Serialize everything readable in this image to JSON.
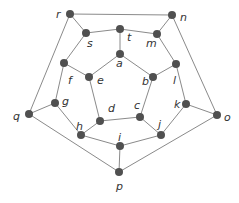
{
  "diagram": {
    "type": "graph",
    "nodes": [
      {
        "id": "r",
        "label": "r",
        "x": 70,
        "y": 14,
        "lx": 56,
        "ly": 18
      },
      {
        "id": "n",
        "label": "n",
        "x": 172,
        "y": 15,
        "lx": 180,
        "ly": 21
      },
      {
        "id": "s",
        "label": "s",
        "x": 86,
        "y": 33,
        "lx": 87,
        "ly": 47
      },
      {
        "id": "t",
        "label": "t",
        "x": 120,
        "y": 29,
        "lx": 127,
        "ly": 41
      },
      {
        "id": "m",
        "label": "m",
        "x": 157,
        "y": 34,
        "lx": 146,
        "ly": 47
      },
      {
        "id": "a",
        "label": "a",
        "x": 120,
        "y": 54,
        "lx": 116,
        "ly": 67
      },
      {
        "id": "f",
        "label": "f",
        "x": 64,
        "y": 63,
        "lx": 68,
        "ly": 84
      },
      {
        "id": "e",
        "label": "e",
        "x": 89,
        "y": 77,
        "lx": 97,
        "ly": 84
      },
      {
        "id": "b",
        "label": "b",
        "x": 153,
        "y": 77,
        "lx": 142,
        "ly": 85
      },
      {
        "id": "l",
        "label": "l",
        "x": 176,
        "y": 64,
        "lx": 173,
        "ly": 84
      },
      {
        "id": "g",
        "label": "g",
        "x": 55,
        "y": 103,
        "lx": 62,
        "ly": 105
      },
      {
        "id": "d",
        "label": "d",
        "x": 100,
        "y": 121,
        "lx": 108,
        "ly": 112
      },
      {
        "id": "c",
        "label": "c",
        "x": 140,
        "y": 117,
        "lx": 134,
        "ly": 109
      },
      {
        "id": "k",
        "label": "k",
        "x": 186,
        "y": 104,
        "lx": 174,
        "ly": 108
      },
      {
        "id": "q",
        "label": "q",
        "x": 29,
        "y": 114,
        "lx": 13,
        "ly": 120
      },
      {
        "id": "o",
        "label": "o",
        "x": 217,
        "y": 115,
        "lx": 224,
        "ly": 121
      },
      {
        "id": "h",
        "label": "h",
        "x": 81,
        "y": 135,
        "lx": 76,
        "ly": 130
      },
      {
        "id": "i",
        "label": "i",
        "x": 120,
        "y": 146,
        "lx": 118,
        "ly": 141
      },
      {
        "id": "j",
        "label": "j",
        "x": 161,
        "y": 135,
        "lx": 158,
        "ly": 128
      },
      {
        "id": "p",
        "label": "p",
        "x": 119,
        "y": 172,
        "lx": 116,
        "ly": 190
      }
    ],
    "edges": [
      [
        "r",
        "n"
      ],
      [
        "r",
        "s"
      ],
      [
        "r",
        "q"
      ],
      [
        "n",
        "m"
      ],
      [
        "n",
        "o"
      ],
      [
        "s",
        "t"
      ],
      [
        "t",
        "m"
      ],
      [
        "t",
        "a"
      ],
      [
        "s",
        "f"
      ],
      [
        "m",
        "l"
      ],
      [
        "a",
        "e"
      ],
      [
        "a",
        "b"
      ],
      [
        "f",
        "e"
      ],
      [
        "b",
        "l"
      ],
      [
        "f",
        "g"
      ],
      [
        "l",
        "k"
      ],
      [
        "e",
        "d"
      ],
      [
        "b",
        "c"
      ],
      [
        "d",
        "c"
      ],
      [
        "g",
        "q"
      ],
      [
        "g",
        "h"
      ],
      [
        "k",
        "o"
      ],
      [
        "k",
        "j"
      ],
      [
        "d",
        "h"
      ],
      [
        "c",
        "j"
      ],
      [
        "h",
        "i"
      ],
      [
        "i",
        "j"
      ],
      [
        "i",
        "p"
      ],
      [
        "q",
        "p"
      ],
      [
        "o",
        "p"
      ]
    ]
  }
}
